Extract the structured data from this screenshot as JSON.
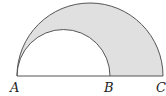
{
  "figure": {
    "type": "geometric-diagram",
    "shade_color": "#e0e0e0",
    "stroke_color": "#555555",
    "points": [
      {
        "label": "A",
        "x": 17,
        "y": 76
      },
      {
        "label": "B",
        "x": 110,
        "y": 76
      },
      {
        "label": "C",
        "x": 163,
        "y": 76
      }
    ],
    "outer_semicircle": {
      "diameter": "AC",
      "center_x": 90,
      "radius": 73
    },
    "inner_semicircle": {
      "diameter": "AB",
      "center_x": 63.5,
      "radius": 46.5
    },
    "labels": {
      "a": "A",
      "b": "B",
      "c": "C"
    }
  }
}
